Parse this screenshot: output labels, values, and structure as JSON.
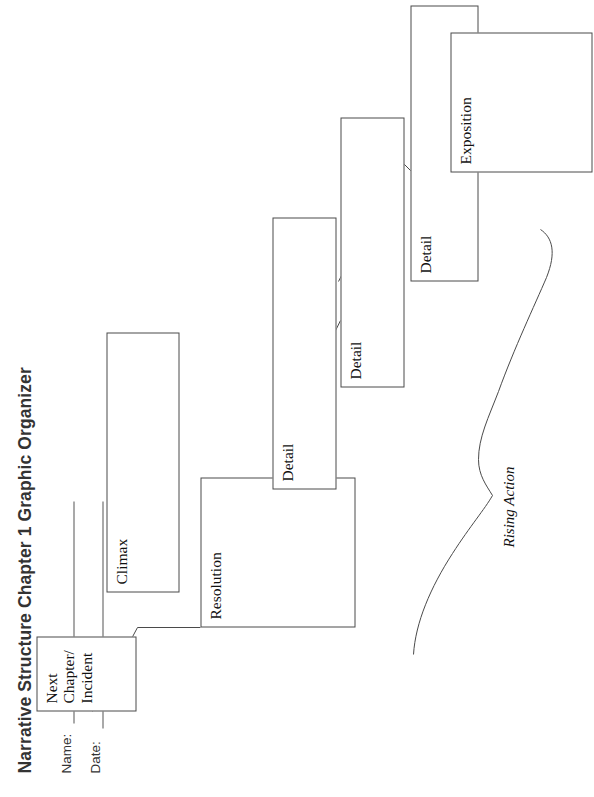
{
  "page": {
    "title": "Narrative Structure Chapter 1 Graphic Organizer",
    "orientation_note": "rotated"
  },
  "fields": [
    {
      "label": "Name:",
      "value": ""
    },
    {
      "label": "Date:",
      "value": ""
    }
  ],
  "diagram": {
    "brace_label": "Rising Action",
    "boxes": [
      {
        "id": "exposition",
        "label": "Exposition"
      },
      {
        "id": "detail-1",
        "label": "Detail"
      },
      {
        "id": "detail-2",
        "label": "Detail"
      },
      {
        "id": "detail-3",
        "label": "Detail"
      },
      {
        "id": "climax",
        "label": "Climax"
      },
      {
        "id": "resolution",
        "label": "Resolution"
      },
      {
        "id": "next-chapter",
        "label": "Next\nChapter/\nIncident"
      }
    ]
  },
  "colors": {
    "line": "#4a4a4a",
    "text": "#111111",
    "heading": "#333333",
    "background": "#ffffff"
  }
}
